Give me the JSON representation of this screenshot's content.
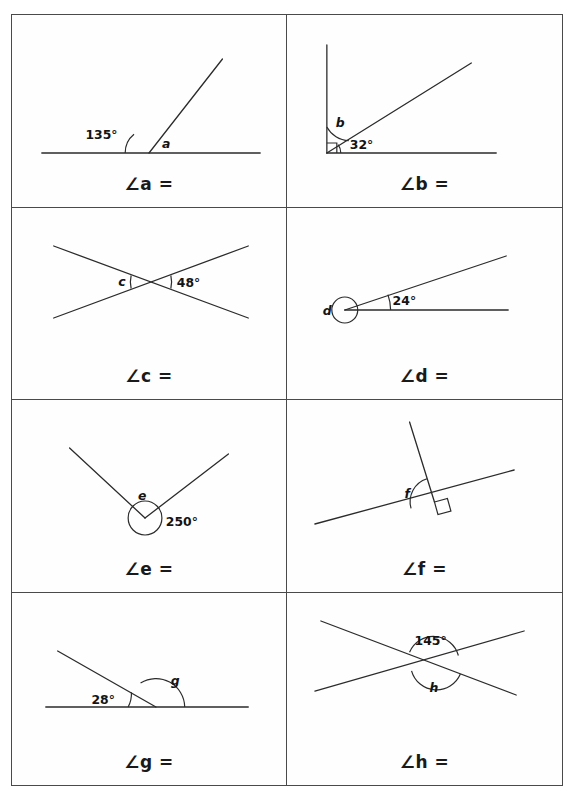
{
  "worksheet": {
    "columns": 2,
    "rows": 4,
    "ink_color": "#2b2b2b",
    "border_color": "#4a4a4a",
    "background_color": "#fefefe"
  },
  "problems": [
    {
      "id": "a",
      "answer_label": "∠a =",
      "angle_symbol": "∠",
      "variable": "a",
      "equals": "=",
      "given_label": "135°",
      "variable_label": "a",
      "figure_type": "angle-on-straight-line",
      "description": "A ray from a point on a horizontal straight line; the marked angle of 135 degrees is on the left of the ray and angle a is on the right."
    },
    {
      "id": "b",
      "answer_label": "∠b =",
      "angle_symbol": "∠",
      "variable": "b",
      "equals": "=",
      "given_label": "32°",
      "variable_label": "b",
      "figure_type": "angle-in-right-angle",
      "description": "A vertical ray and a horizontal ray meeting at a right angle with a square marker; a diagonal ray splits the right angle into angle b and 32 degrees."
    },
    {
      "id": "c",
      "answer_label": "∠c =",
      "angle_symbol": "∠",
      "variable": "c",
      "equals": "=",
      "given_label": "48°",
      "variable_label": "c",
      "figure_type": "vertically-opposite-angles",
      "description": "Two straight lines crossing in an X shape; angle c on the left of the crossing point is vertically opposite the 48 degree angle on the right."
    },
    {
      "id": "d",
      "answer_label": "∠d =",
      "angle_symbol": "∠",
      "variable": "d",
      "equals": "=",
      "given_label": "24°",
      "variable_label": "d",
      "figure_type": "reflex-angle",
      "description": "A horizontal ray and a diagonal ray making 24 degrees; the reflex angle d around the vertex is shown with a full circle."
    },
    {
      "id": "e",
      "answer_label": "∠e =",
      "angle_symbol": "∠",
      "variable": "e",
      "equals": "=",
      "given_label": "250°",
      "variable_label": "e",
      "figure_type": "reflex-angle",
      "description": "Two rays forming a V with the vertex at the bottom; the reflex angle of 250 degrees is shown with a full circle and angle e is inside the V."
    },
    {
      "id": "f",
      "answer_label": "∠f =",
      "angle_symbol": "∠",
      "variable": "f",
      "equals": "=",
      "given_label": "",
      "variable_label": "f",
      "figure_type": "perpendicular-on-line",
      "description": "A slanted straight line with a perpendicular ray marked by a right-angle square; angle f is on the left side of the perpendicular."
    },
    {
      "id": "g",
      "answer_label": "∠g =",
      "angle_symbol": "∠",
      "variable": "g",
      "equals": "=",
      "given_label": "28°",
      "variable_label": "g",
      "figure_type": "angle-on-straight-line",
      "description": "A horizontal straight line with a ray going up to the left at 28 degrees; angle g is the supplementary angle on the right."
    },
    {
      "id": "h",
      "answer_label": "∠h =",
      "angle_symbol": "∠",
      "variable": "h",
      "equals": "=",
      "given_label": "145°",
      "variable_label": "h",
      "figure_type": "vertically-opposite-angles",
      "description": "Two straight lines crossing; the 145 degree angle above the crossing point is vertically opposite angle h below it."
    }
  ]
}
